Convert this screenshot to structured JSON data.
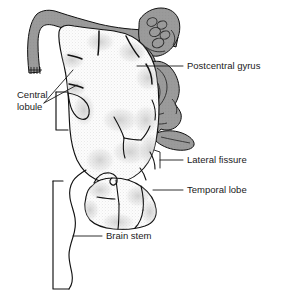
{
  "figure": {
    "background_color": "#ffffff",
    "line_color": "#111111",
    "gray_structure_color": "#9a9a9a",
    "cortex_color": "#fbfbfb",
    "stipple_color": "#b9b9b9",
    "width": 281,
    "height": 302
  },
  "labels": [
    {
      "id": "postcentral-gyrus",
      "text": "Postcentral gyrus",
      "text_x": 187,
      "text_y": 66,
      "anchor": "start",
      "leader": "M 137 66 L 183 66"
    },
    {
      "id": "central-lobule",
      "text_line1": "Central",
      "text_line2": "lobule",
      "text_x": 17,
      "text_y": 101,
      "line_height": 12,
      "anchor": "start",
      "leader_1": "M 44 103 L 73 70",
      "leader_2": "M 44 103 L 77 85"
    },
    {
      "id": "lateral-fissure",
      "text": "Lateral fissure",
      "text_x": 187,
      "text_y": 160,
      "anchor": "start",
      "leader": "M 160 160 L 183 160",
      "hook": "M 160 152 L 160 168"
    },
    {
      "id": "temporal-lobe",
      "text": "Temporal lobe",
      "text_x": 187,
      "text_y": 190,
      "anchor": "start",
      "leader": "M 153 190 L 183 190"
    },
    {
      "id": "brain-stem",
      "text": "Brain stem",
      "text_x": 106,
      "text_y": 236,
      "anchor": "start",
      "leader": "M 73 236 L 102 236"
    }
  ],
  "structures": [
    {
      "id": "dura-band",
      "name": "dural-band",
      "color": "#9a9a9a"
    },
    {
      "id": "cerebellum-lobules",
      "name": "cerebellar-lobules",
      "color": "#9a9a9a"
    },
    {
      "id": "brainstem-profile",
      "name": "brainstem-profile-structure",
      "color": "#9a9a9a"
    },
    {
      "id": "cerebral-cortex",
      "name": "cerebral-cortex",
      "color": "#fbfbfb"
    },
    {
      "id": "temporal-lobe-body",
      "name": "temporal-lobe",
      "color": "#fbfbfb"
    },
    {
      "id": "brain-stem-outline",
      "name": "brain-stem",
      "color": "#ffffff"
    }
  ]
}
